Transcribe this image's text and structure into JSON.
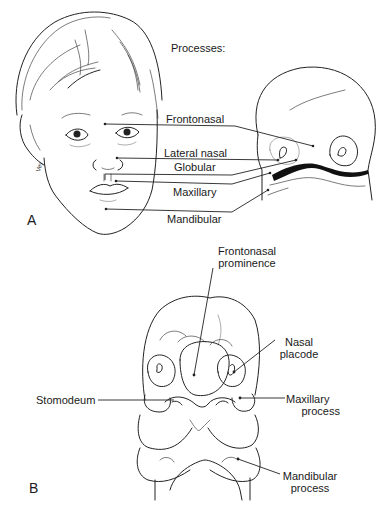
{
  "figure": {
    "panel_a": {
      "panel_label": "A",
      "heading": "Processes:",
      "labels": [
        {
          "text": "Frontonasal"
        },
        {
          "text": "Lateral nasal"
        },
        {
          "text": "Globular"
        },
        {
          "text": "Maxillary"
        },
        {
          "text": "Mandibular"
        }
      ],
      "signature": "Vey"
    },
    "panel_b": {
      "panel_label": "B",
      "labels": [
        {
          "line1": "Frontonasal",
          "line2": "prominence"
        },
        {
          "line1": "Nasal",
          "line2": "placode"
        },
        {
          "line1": "Stomodeum",
          "line2": ""
        },
        {
          "line1": "Maxillary",
          "line2": "process"
        },
        {
          "line1": "Mandibular",
          "line2": "process"
        }
      ]
    }
  }
}
